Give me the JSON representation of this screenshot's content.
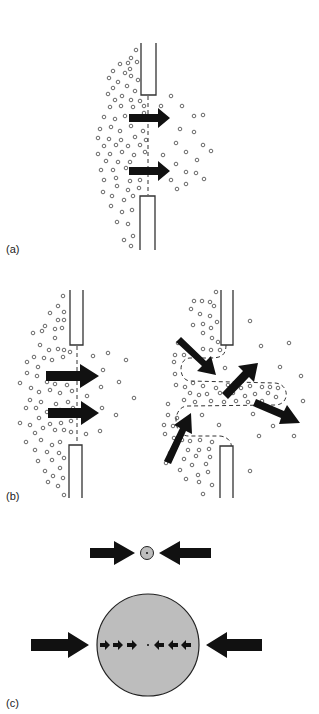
{
  "panels": [
    {
      "id": "a",
      "label": "(a)",
      "description": "Particles pass through an open gap between two walls; two arrows indicate flow through the gap."
    },
    {
      "id": "b",
      "label": "(b)",
      "description": "Left: flow through a gap (two arrows). Right: bulging flow with dashed outline and four arrows indicating inflow and outflow."
    },
    {
      "id": "c",
      "label": "(c)",
      "description": "Small gray circle compressed by two opposing arrows; below, a large gray circle with opposing external arrows and internal row of small arrows pointing to a central dot."
    }
  ],
  "colors": {
    "arrow": "#111111",
    "wall": "#333333",
    "particle": "#444444",
    "circle_fill": "#bdbdbd",
    "circle_stroke": "#222222",
    "background": "#ffffff"
  }
}
